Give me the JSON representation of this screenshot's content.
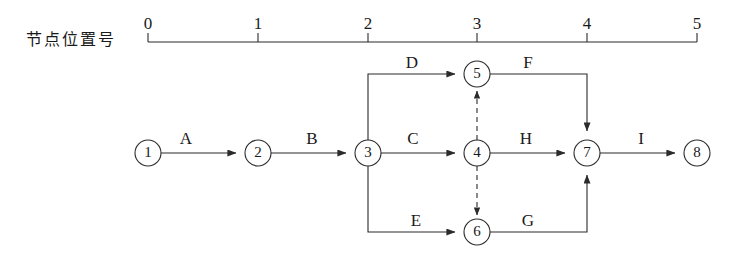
{
  "diagram": {
    "title": "",
    "type": "activity-on-arrow-network",
    "axis": {
      "label": "节点位置号",
      "ticks": [
        {
          "value": "0",
          "x": 148
        },
        {
          "value": "1",
          "x": 258
        },
        {
          "value": "2",
          "x": 368
        },
        {
          "value": "3",
          "x": 477
        },
        {
          "value": "4",
          "x": 587
        },
        {
          "value": "5",
          "x": 697
        }
      ],
      "line_y": 42,
      "tick_height": 9
    },
    "nodes": [
      {
        "id": "1",
        "label": "1",
        "x": 148,
        "y": 153,
        "r": 13
      },
      {
        "id": "2",
        "label": "2",
        "x": 258,
        "y": 153,
        "r": 13
      },
      {
        "id": "3",
        "label": "3",
        "x": 368,
        "y": 153,
        "r": 13
      },
      {
        "id": "4",
        "label": "4",
        "x": 477,
        "y": 153,
        "r": 13
      },
      {
        "id": "5",
        "label": "5",
        "x": 477,
        "y": 74,
        "r": 13
      },
      {
        "id": "6",
        "label": "6",
        "x": 477,
        "y": 232,
        "r": 13
      },
      {
        "id": "7",
        "label": "7",
        "x": 587,
        "y": 153,
        "r": 13
      },
      {
        "id": "8",
        "label": "8",
        "x": 697,
        "y": 153,
        "r": 13
      }
    ],
    "activities": [
      {
        "id": "A",
        "label": "A",
        "from": "1",
        "to": "2",
        "label_x": 186,
        "label_y": 144,
        "style": "solid"
      },
      {
        "id": "B",
        "label": "B",
        "from": "2",
        "to": "3",
        "label_x": 312,
        "label_y": 144,
        "style": "solid"
      },
      {
        "id": "C",
        "label": "C",
        "from": "3",
        "to": "4",
        "label_x": 413,
        "label_y": 144,
        "style": "solid"
      },
      {
        "id": "D",
        "label": "D",
        "from": "3",
        "to": "5",
        "label_x": 412,
        "label_y": 68,
        "style": "solid"
      },
      {
        "id": "E",
        "label": "E",
        "from": "3",
        "to": "6",
        "label_x": 416,
        "label_y": 226,
        "style": "solid"
      },
      {
        "id": "F",
        "label": "F",
        "from": "5",
        "to": "7",
        "label_x": 528,
        "label_y": 68,
        "style": "solid"
      },
      {
        "id": "G",
        "label": "G",
        "from": "6",
        "to": "7",
        "label_x": 528,
        "label_y": 226,
        "style": "solid"
      },
      {
        "id": "H",
        "label": "H",
        "from": "4",
        "to": "7",
        "label_x": 526,
        "label_y": 144,
        "style": "solid"
      },
      {
        "id": "I",
        "label": "I",
        "from": "7",
        "to": "8",
        "label_x": 641,
        "label_y": 144,
        "style": "solid"
      }
    ],
    "dummy_activities": [
      {
        "id": "dummy-4-5",
        "from": "4",
        "to": "5",
        "style": "dashed"
      },
      {
        "id": "dummy-4-6",
        "from": "4",
        "to": "6",
        "style": "dashed"
      }
    ],
    "colors": {
      "stroke": "#2b2b2b",
      "text": "#1a1a1a",
      "background": "#ffffff"
    }
  }
}
